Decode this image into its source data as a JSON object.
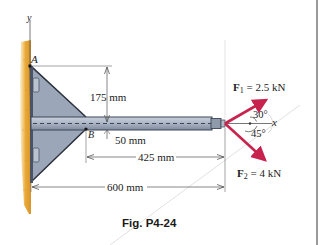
{
  "figure": {
    "caption": "Fig. P4-24",
    "axes": {
      "y_label": "y",
      "x_label": "x"
    },
    "points": {
      "A": "A",
      "B": "B"
    },
    "dimensions": {
      "vertical_A_to_beam": "175 mm",
      "beam_half_height": "50 mm",
      "B_to_tip": "425 mm",
      "wall_to_tip": "600 mm"
    },
    "forces": [
      {
        "symbol": "F",
        "subscript": "1",
        "value": "= 2.5 kN",
        "angle": "30°",
        "direction": "up-right"
      },
      {
        "symbol": "F",
        "subscript": "2",
        "value": "= 4 kN",
        "angle": "45°",
        "direction": "down-right"
      }
    ],
    "colors": {
      "wall": "#e8a93a",
      "bracket": "#9aa6b8",
      "beam": "#a9b4c4",
      "force_arrow": "#c8234e",
      "dimension_line": "#555555"
    }
  }
}
